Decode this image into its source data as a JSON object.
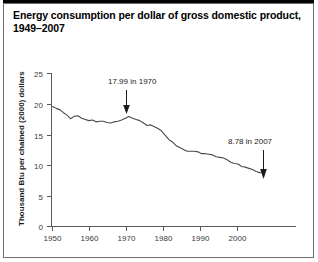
{
  "figure": {
    "title": "Energy consumption per dollar of gross domestic product, 1949–2007"
  },
  "chart_data": {
    "type": "line",
    "title": "Energy consumption per dollar of gross domestic product, 1949–2007",
    "xlabel": "",
    "ylabel": "Thousand Btu per chained (2000) dollars",
    "xlim": [
      1949,
      2007
    ],
    "ylim": [
      0,
      25
    ],
    "yticks": [
      0,
      5,
      10,
      15,
      20,
      25
    ],
    "ytick_labels": [
      "0",
      "5",
      "10",
      "15",
      "20",
      "25"
    ],
    "xticks": [
      1950,
      1960,
      1970,
      1980,
      1990,
      2000
    ],
    "xtick_labels": [
      "1950",
      "1960",
      "1970",
      "1980",
      "1990",
      "2000"
    ],
    "grid": false,
    "legend": false,
    "line_color": "#4a4a4a",
    "series": [
      {
        "name": "Energy consumption per dollar of GDP",
        "x": [
          1949,
          1950,
          1951,
          1952,
          1953,
          1954,
          1955,
          1956,
          1957,
          1958,
          1959,
          1960,
          1961,
          1962,
          1963,
          1964,
          1965,
          1966,
          1967,
          1968,
          1969,
          1970,
          1971,
          1972,
          1973,
          1974,
          1975,
          1976,
          1977,
          1978,
          1979,
          1980,
          1981,
          1982,
          1983,
          1984,
          1985,
          1986,
          1987,
          1988,
          1989,
          1990,
          1991,
          1992,
          1993,
          1994,
          1995,
          1996,
          1997,
          1998,
          1999,
          2000,
          2001,
          2002,
          2003,
          2004,
          2005,
          2006,
          2007
        ],
        "y": [
          19.6,
          19.3,
          19.1,
          18.6,
          18.2,
          17.6,
          18.0,
          18.1,
          17.7,
          17.5,
          17.3,
          17.4,
          17.1,
          17.2,
          17.2,
          17.0,
          16.9,
          17.1,
          17.2,
          17.4,
          17.7,
          17.99,
          17.7,
          17.5,
          17.3,
          16.9,
          16.5,
          16.6,
          16.3,
          16.0,
          15.6,
          14.9,
          14.2,
          13.8,
          13.2,
          12.9,
          12.6,
          12.3,
          12.3,
          12.3,
          12.2,
          11.9,
          11.9,
          11.8,
          11.7,
          11.4,
          11.3,
          11.2,
          10.9,
          10.5,
          10.3,
          10.2,
          9.8,
          9.7,
          9.5,
          9.3,
          9.0,
          8.8,
          8.78
        ]
      }
    ],
    "annotations": [
      {
        "label": "17.99 in 1970",
        "x": 1970,
        "y": 17.99,
        "arrow": "down"
      },
      {
        "label": "8.78 in 2007",
        "x": 2007,
        "y": 8.78,
        "arrow": "down"
      }
    ]
  }
}
